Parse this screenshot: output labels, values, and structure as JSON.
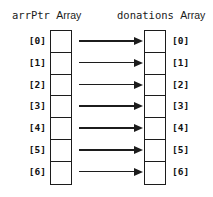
{
  "diagram": {
    "width": 213,
    "height": 197,
    "background_color": "#ffffff",
    "line_color": "#1c1c1c",
    "text_color": "#111111"
  },
  "left_column": {
    "heading_name": "arrPtr",
    "heading_suffix": "Array",
    "indices": [
      "[0]",
      "[1]",
      "[2]",
      "[3]",
      "[4]",
      "[5]",
      "[6]"
    ],
    "cell_count": 7,
    "cell_values": [
      "",
      "",
      "",
      "",
      "",
      "",
      ""
    ]
  },
  "right_column": {
    "heading_name": "donations",
    "heading_suffix": "Array",
    "indices": [
      "[0]",
      "[1]",
      "[2]",
      "[3]",
      "[4]",
      "[5]",
      "[6]"
    ],
    "cell_count": 7,
    "cell_values": [
      "",
      "",
      "",
      "",
      "",
      "",
      ""
    ]
  },
  "arrows": {
    "count": 7,
    "direction": "left-to-right",
    "style": "solid-line-with-filled-arrowhead",
    "semantic": "each arrPtr element points to the corresponding donations element"
  }
}
